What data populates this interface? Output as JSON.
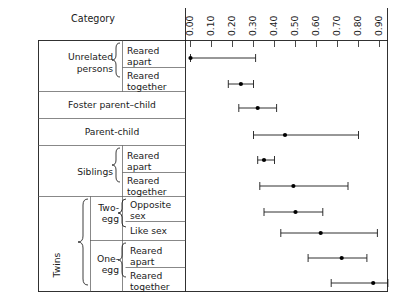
{
  "header": {
    "category_title": "Category"
  },
  "chart_data": {
    "type": "scatter",
    "title": "",
    "xlabel": "",
    "ylabel": "Category",
    "xlim": [
      0.0,
      0.95
    ],
    "xticks": [
      0.0,
      0.1,
      0.2,
      0.3,
      0.4,
      0.5,
      0.6,
      0.7,
      0.8,
      0.9
    ],
    "xticklabels": [
      "0.00",
      "0.10",
      "0.20",
      "0.30",
      "0.40",
      "0.50",
      "0.60",
      "0.70",
      "0.80",
      "0.90"
    ],
    "grid": false,
    "legend": "none",
    "value_label": "Correlation coefficient",
    "error_bar_style": "range-with-caps",
    "marker": "filled-circle",
    "rows": [
      {
        "group": "Unrelated persons",
        "subgroup": "",
        "condition": "Reared apart",
        "value": 0.0,
        "low": 0.0,
        "high": 0.31
      },
      {
        "group": "Unrelated persons",
        "subgroup": "",
        "condition": "Reared together",
        "value": 0.24,
        "low": 0.18,
        "high": 0.3
      },
      {
        "group": "Foster parent–child",
        "subgroup": "",
        "condition": "",
        "value": 0.32,
        "low": 0.23,
        "high": 0.41
      },
      {
        "group": "Parent-child",
        "subgroup": "",
        "condition": "",
        "value": 0.45,
        "low": 0.3,
        "high": 0.8
      },
      {
        "group": "Siblings",
        "subgroup": "",
        "condition": "Reared apart",
        "value": 0.35,
        "low": 0.32,
        "high": 0.4
      },
      {
        "group": "Siblings",
        "subgroup": "",
        "condition": "Reared together",
        "value": 0.49,
        "low": 0.33,
        "high": 0.75
      },
      {
        "group": "Twins",
        "subgroup": "Two-egg",
        "condition": "Opposite sex",
        "value": 0.5,
        "low": 0.35,
        "high": 0.63
      },
      {
        "group": "Twins",
        "subgroup": "Two-egg",
        "condition": "Like sex",
        "value": 0.62,
        "low": 0.43,
        "high": 0.89
      },
      {
        "group": "Twins",
        "subgroup": "One-egg",
        "condition": "Reared apart",
        "value": 0.72,
        "low": 0.56,
        "high": 0.84
      },
      {
        "group": "Twins",
        "subgroup": "One-egg",
        "condition": "Reared together",
        "value": 0.87,
        "low": 0.67,
        "high": 0.94
      }
    ]
  },
  "labels": {
    "unrelated_persons_line1": "Unrelated",
    "unrelated_persons_line2": "persons",
    "reared_line1": "Reared",
    "apart": "apart",
    "together": "together",
    "foster_parent_child": "Foster parent–child",
    "parent_child": "Parent-child",
    "siblings": "Siblings",
    "twins": "Twins",
    "two_egg_line1": "Two-",
    "two_egg_line2": "egg",
    "one_egg_line1": "One-",
    "one_egg_line2": "egg",
    "opposite": "Opposite",
    "sex": "sex",
    "like_sex": "Like sex"
  }
}
